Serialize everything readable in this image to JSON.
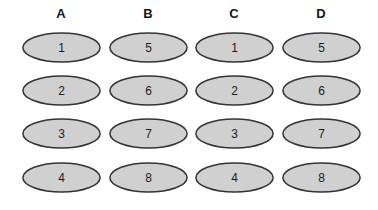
{
  "figure": {
    "type": "grouped-node-diagram",
    "background_color": "#ffffff",
    "node_fill_color": "#d0d0d0",
    "node_stroke_color": "#333333",
    "label_color": "#1a1a1a",
    "header_color": "#151515"
  },
  "columns": [
    {
      "header": "A",
      "nodes": [
        {
          "label": "1"
        },
        {
          "label": "2"
        },
        {
          "label": "3"
        },
        {
          "label": "4"
        }
      ]
    },
    {
      "header": "B",
      "nodes": [
        {
          "label": "5"
        },
        {
          "label": "6"
        },
        {
          "label": "7"
        },
        {
          "label": "8"
        }
      ]
    },
    {
      "header": "C",
      "nodes": [
        {
          "label": "1"
        },
        {
          "label": "2"
        },
        {
          "label": "3"
        },
        {
          "label": "4"
        }
      ]
    },
    {
      "header": "D",
      "nodes": [
        {
          "label": "5"
        },
        {
          "label": "6"
        },
        {
          "label": "7"
        },
        {
          "label": "8"
        }
      ]
    }
  ]
}
